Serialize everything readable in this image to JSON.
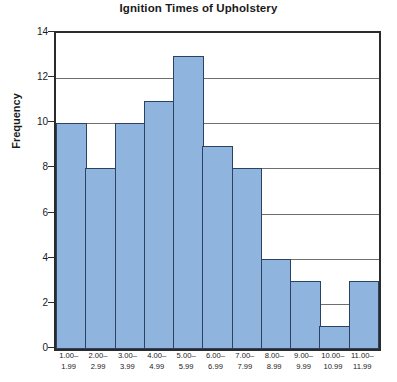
{
  "chart_data": {
    "type": "bar",
    "title": "Ignition Times of Upholstery",
    "xlabel": "",
    "ylabel": "Frequency",
    "categories": [
      "1.00–1.99",
      "2.00–2.99",
      "3.00–3.99",
      "4.00–4.99",
      "5.00–5.99",
      "6.00–6.99",
      "7.00–7.99",
      "8.00–8.99",
      "9.00–9.99",
      "10.00–10.99",
      "11.00–11.99"
    ],
    "category_lines": [
      [
        "1.00–",
        "1.99"
      ],
      [
        "2.00–",
        "2.99"
      ],
      [
        "3.00–",
        "3.99"
      ],
      [
        "4.00–",
        "4.99"
      ],
      [
        "5.00–",
        "5.99"
      ],
      [
        "6.00–",
        "6.99"
      ],
      [
        "7.00–",
        "7.99"
      ],
      [
        "8.00–",
        "8.99"
      ],
      [
        "9.00–",
        "9.99"
      ],
      [
        "10.00–",
        "10.99"
      ],
      [
        "11.00–",
        "11.99"
      ]
    ],
    "values": [
      10,
      8,
      10,
      11,
      13,
      9,
      8,
      4,
      3,
      1,
      3
    ],
    "ylim": [
      0,
      14
    ],
    "yticks": [
      0,
      2,
      4,
      6,
      8,
      10,
      12,
      14
    ],
    "grid": true,
    "legend": false,
    "colors": {
      "bar_fill": "#8fb4de",
      "bar_border": "#2c4262",
      "axis": "#2b2b2b",
      "gridline": "#6e6e6e",
      "text": "#1a1a1a",
      "background": "#ffffff"
    }
  }
}
